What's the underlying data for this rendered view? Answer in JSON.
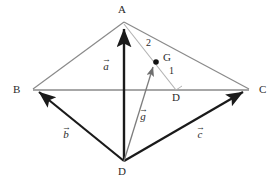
{
  "figure": {
    "colors": {
      "edge_gray": "#8a8a8a",
      "edge_light": "#a9a9a9",
      "vector_black": "#1a1a1a",
      "vector_gray": "#7d7d7d",
      "point_fill": "#111111",
      "background": "#ffffff",
      "text": "#2b2b2b"
    },
    "points": {
      "A": {
        "label": "A",
        "x": 124,
        "y": 22
      },
      "B": {
        "label": "B",
        "x": 32,
        "y": 90
      },
      "C": {
        "label": "C",
        "x": 250,
        "y": 90
      },
      "D_bottom": {
        "label": "D",
        "x": 124,
        "y": 162
      },
      "D_inner": {
        "label": "D",
        "x": 176,
        "y": 90
      },
      "G": {
        "label": "G",
        "x": 156,
        "y": 62
      }
    },
    "vertex_labels": [
      {
        "name": "point-label-a",
        "text": "A",
        "x": 118,
        "y": 4
      },
      {
        "name": "point-label-b",
        "text": "B",
        "x": 13,
        "y": 84
      },
      {
        "name": "point-label-c",
        "text": "C",
        "x": 259,
        "y": 84
      },
      {
        "name": "point-label-d-bottom",
        "text": "D",
        "x": 118,
        "y": 166
      },
      {
        "name": "point-label-d-inner",
        "text": "D",
        "x": 172,
        "y": 92
      },
      {
        "name": "point-label-g",
        "text": "G",
        "x": 163,
        "y": 52
      }
    ],
    "ratio_labels": [
      {
        "name": "ratio-label-2",
        "text": "2",
        "x": 146,
        "y": 38
      },
      {
        "name": "ratio-label-1",
        "text": "1",
        "x": 169,
        "y": 66
      }
    ],
    "vector_labels": [
      {
        "name": "vector-label-a",
        "letter": "a",
        "bar": "→",
        "x": 102,
        "y": 60
      },
      {
        "name": "vector-label-b",
        "letter": "b",
        "bar": "→",
        "x": 62,
        "y": 128
      },
      {
        "name": "vector-label-c",
        "letter": "c",
        "bar": "→",
        "x": 196,
        "y": 128
      },
      {
        "name": "vector-label-g",
        "letter": "g",
        "bar": "→",
        "x": 139,
        "y": 110
      }
    ],
    "edges": [
      {
        "name": "edge-a-b",
        "from": "A",
        "to": "B",
        "style": "gray-thin"
      },
      {
        "name": "edge-a-c",
        "from": "A",
        "to": "C",
        "style": "gray-thin"
      },
      {
        "name": "edge-b-c",
        "from": "B",
        "to": "C",
        "style": "gray-thin"
      },
      {
        "name": "edge-a-d-inner",
        "from": "A",
        "to": "D_inner",
        "style": "gray-light"
      },
      {
        "name": "edge-d-bottom-c",
        "from": "D_bottom",
        "to": "C",
        "style": "black-thick"
      },
      {
        "name": "edge-d-bottom-b",
        "from": "D_bottom",
        "to": "B",
        "style": "black-thick"
      }
    ],
    "vectors": [
      {
        "name": "vector-a",
        "from": "D_bottom",
        "to": "A",
        "style": "black-thick",
        "label": "a"
      },
      {
        "name": "vector-b",
        "from": "D_bottom",
        "to": "B",
        "style": "black-thick",
        "label": "b"
      },
      {
        "name": "vector-c",
        "from": "D_bottom",
        "to": "C",
        "style": "black-thick",
        "label": "c"
      },
      {
        "name": "vector-g",
        "from": "D_bottom",
        "to": "G",
        "style": "gray-thin",
        "label": "g"
      }
    ]
  }
}
